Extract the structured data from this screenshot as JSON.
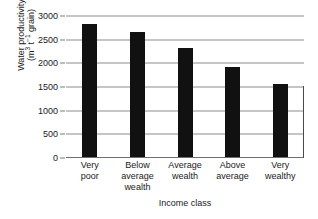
{
  "chart_data": {
    "type": "bar",
    "title": "",
    "subtitle": "",
    "xlabel": "Income class",
    "ylabel": "Water productivity (m3 t-1 grain)",
    "ylabel_line1": "Water productivity",
    "ylabel_line2_prefix": "(m",
    "ylabel_line2_sup1": "3",
    "ylabel_line2_mid": " t",
    "ylabel_line2_sup2": "−1",
    "ylabel_line2_suffix": " grain)",
    "categories": [
      "Very\npoor",
      "Below\naverage\nwealth",
      "Average\nwealth",
      "Above\naverage",
      "Very\nwealthy"
    ],
    "values": [
      2840,
      2660,
      2330,
      1920,
      1560
    ],
    "ylim": [
      0,
      3000
    ],
    "yticks": [
      0,
      500,
      1000,
      1500,
      2000,
      2500,
      3000
    ],
    "ytick_labels": [
      "0",
      "500",
      "1000",
      "1500",
      "2000",
      "2500",
      "3000"
    ],
    "grid": true,
    "grid_axis": "y",
    "legend": false,
    "legend_position": "none",
    "bar_color": "#111111",
    "grid_color": "#8c8c8c",
    "axis_color": "#4a4a4a",
    "text_color": "#1a1a1a"
  }
}
